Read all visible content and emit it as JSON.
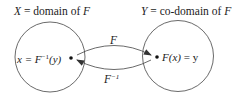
{
  "domain_label": {
    "var": "X",
    "text": " = domain of ",
    "fn": "F"
  },
  "codomain_label": {
    "var": "Y",
    "text": " = co-domain of ",
    "fn": "F"
  },
  "left_point": {
    "prefix": "x = ",
    "fn": "F",
    "exp": "−1",
    "arg": "(y)"
  },
  "right_point": {
    "fn": "F",
    "arg": "(x)",
    "suffix": " = y"
  },
  "forward_arrow": {
    "label": "F"
  },
  "inverse_arrow": {
    "label": "F",
    "exp": "−1"
  },
  "colors": {
    "stroke": "#333333",
    "text": "#222222"
  }
}
